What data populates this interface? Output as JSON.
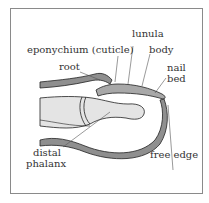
{
  "diagram": {
    "title": "",
    "labels": {
      "lunula": "lunula",
      "eponychium": "eponychium (cuticle)",
      "body": "body",
      "root": "root",
      "nail_bed_1": "nail",
      "nail_bed_2": "bed",
      "distal_phalanx_1": "distal",
      "distal_phalanx_2": "phalanx",
      "free_edge": "free edge"
    },
    "colors": {
      "skin_fill": "#8f8f8f",
      "bone_fill": "#e4e4e4",
      "nail_fill": "#a8a8a8",
      "outline": "#222222",
      "frame": "#8a8a8a"
    }
  }
}
